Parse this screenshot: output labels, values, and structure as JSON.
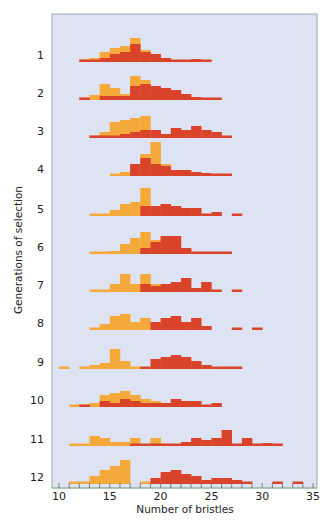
{
  "chart_data": {
    "type": "bar",
    "subtype": "stacked-histograms-by-generation",
    "title": "",
    "xlabel": "Number of bristles",
    "ylabel": "Generations of selection",
    "xlim": [
      10,
      35
    ],
    "xticks": [
      10,
      15,
      20,
      25,
      30,
      35
    ],
    "grid": false,
    "legend": null,
    "colors": {
      "low_line": "#F5A93A",
      "high_line": "#D9432A",
      "plot_bg": "#DDE3F2",
      "axis": "#9AA3B8"
    },
    "bin_start": 10,
    "bin_width": 1,
    "units_note": "relative frequency heights (px-scale estimates)",
    "generations": [
      {
        "gen": "1",
        "low": [
          0,
          0,
          2,
          4,
          10,
          14,
          16,
          24,
          12,
          8,
          4,
          0,
          0,
          0,
          0,
          0,
          0,
          0,
          0,
          0,
          0,
          0,
          0,
          0,
          0
        ],
        "high": [
          0,
          0,
          2,
          2,
          4,
          8,
          10,
          18,
          10,
          8,
          4,
          2,
          2,
          3,
          2,
          0,
          0,
          0,
          0,
          0,
          0,
          0,
          0,
          0,
          0
        ]
      },
      {
        "gen": "2",
        "low": [
          0,
          0,
          2,
          5,
          16,
          12,
          6,
          24,
          20,
          12,
          8,
          4,
          2,
          1,
          0,
          0,
          0,
          0,
          0,
          0,
          0,
          0,
          0,
          0,
          0
        ],
        "high": [
          0,
          0,
          2,
          0,
          4,
          4,
          4,
          14,
          16,
          14,
          12,
          10,
          6,
          3,
          2,
          1,
          0,
          0,
          0,
          0,
          0,
          0,
          0,
          0,
          0
        ]
      },
      {
        "gen": "3",
        "low": [
          0,
          0,
          0,
          1,
          6,
          16,
          18,
          20,
          22,
          0,
          0,
          0,
          0,
          0,
          0,
          0,
          0,
          0,
          0,
          0,
          0,
          0,
          0,
          0,
          0
        ],
        "high": [
          0,
          0,
          0,
          1,
          1,
          2,
          4,
          6,
          8,
          8,
          4,
          10,
          8,
          12,
          8,
          6,
          1,
          0,
          0,
          0,
          0,
          0,
          0,
          0,
          0
        ]
      },
      {
        "gen": "4",
        "low": [
          0,
          0,
          0,
          0,
          0,
          2,
          4,
          12,
          22,
          34,
          12,
          0,
          0,
          0,
          0,
          0,
          0,
          0,
          0,
          0,
          0,
          0,
          0,
          0,
          0
        ],
        "high": [
          0,
          0,
          0,
          0,
          0,
          0,
          0,
          12,
          18,
          12,
          10,
          6,
          6,
          4,
          3,
          1,
          1,
          0,
          0,
          0,
          0,
          0,
          0,
          0,
          0
        ]
      },
      {
        "gen": "5",
        "low": [
          0,
          0,
          0,
          1,
          2,
          6,
          12,
          14,
          28,
          0,
          0,
          0,
          0,
          0,
          0,
          0,
          0,
          0,
          0,
          0,
          0,
          0,
          0,
          0,
          0
        ],
        "high": [
          0,
          0,
          0,
          0,
          0,
          0,
          0,
          0,
          10,
          10,
          12,
          10,
          8,
          8,
          2,
          4,
          0,
          1,
          0,
          0,
          0,
          0,
          0,
          0,
          0
        ]
      },
      {
        "gen": "6",
        "low": [
          0,
          0,
          0,
          1,
          2,
          3,
          10,
          16,
          22,
          14,
          18,
          0,
          4,
          0,
          0,
          0,
          0,
          0,
          0,
          0,
          0,
          0,
          0,
          0,
          0
        ],
        "high": [
          0,
          0,
          0,
          0,
          0,
          0,
          0,
          0,
          6,
          12,
          18,
          18,
          6,
          2,
          2,
          1,
          1,
          0,
          0,
          0,
          0,
          0,
          0,
          0,
          0
        ]
      },
      {
        "gen": "7",
        "low": [
          0,
          0,
          0,
          1,
          2,
          8,
          18,
          8,
          18,
          8,
          0,
          0,
          0,
          0,
          0,
          0,
          0,
          0,
          0,
          0,
          0,
          0,
          0,
          0,
          0
        ],
        "high": [
          0,
          0,
          0,
          0,
          0,
          0,
          0,
          0,
          8,
          6,
          8,
          10,
          14,
          4,
          10,
          2,
          0,
          1,
          0,
          0,
          0,
          0,
          0,
          0,
          0
        ]
      },
      {
        "gen": "8",
        "low": [
          0,
          0,
          0,
          2,
          6,
          14,
          16,
          8,
          12,
          0,
          0,
          0,
          0,
          0,
          0,
          0,
          0,
          0,
          0,
          0,
          0,
          0,
          0,
          0,
          0
        ],
        "high": [
          0,
          0,
          0,
          0,
          0,
          0,
          0,
          0,
          0,
          8,
          12,
          14,
          8,
          12,
          4,
          0,
          0,
          1,
          0,
          1,
          0,
          0,
          0,
          0,
          0
        ]
      },
      {
        "gen": "9",
        "low": [
          1,
          0,
          2,
          4,
          6,
          20,
          8,
          2,
          0,
          0,
          0,
          0,
          0,
          0,
          0,
          0,
          0,
          0,
          0,
          0,
          0,
          0,
          0,
          0,
          0
        ],
        "high": [
          0,
          0,
          0,
          0,
          0,
          0,
          0,
          0,
          2,
          10,
          12,
          14,
          12,
          8,
          4,
          2,
          1,
          2,
          0,
          0,
          0,
          0,
          0,
          0,
          0
        ]
      },
      {
        "gen": "10",
        "low": [
          0,
          1,
          2,
          4,
          12,
          14,
          16,
          12,
          8,
          6,
          4,
          0,
          2,
          0,
          0,
          0,
          0,
          0,
          0,
          0,
          0,
          0,
          0,
          0,
          0
        ],
        "high": [
          0,
          0,
          1,
          0,
          6,
          4,
          8,
          6,
          4,
          4,
          4,
          8,
          6,
          6,
          2,
          4,
          0,
          0,
          0,
          0,
          0,
          0,
          0,
          0,
          0
        ]
      },
      {
        "gen": "11",
        "low": [
          0,
          1,
          2,
          10,
          8,
          4,
          4,
          8,
          0,
          8,
          2,
          0,
          0,
          0,
          0,
          0,
          0,
          0,
          0,
          0,
          0,
          0,
          0,
          0,
          0
        ],
        "high": [
          0,
          0,
          0,
          0,
          0,
          0,
          0,
          1,
          2,
          2,
          2,
          2,
          4,
          8,
          6,
          8,
          16,
          2,
          8,
          2,
          3,
          1,
          0,
          0,
          0
        ]
      },
      {
        "gen": "12",
        "low": [
          0,
          1,
          2,
          8,
          14,
          18,
          24,
          0,
          2,
          0,
          0,
          0,
          0,
          0,
          0,
          0,
          0,
          0,
          0,
          0,
          0,
          0,
          0,
          0,
          0
        ],
        "high": [
          0,
          0,
          0,
          0,
          0,
          0,
          0,
          0,
          0,
          6,
          12,
          14,
          10,
          8,
          4,
          6,
          6,
          4,
          1,
          0,
          0,
          1,
          0,
          2,
          0
        ]
      }
    ]
  },
  "axes": {
    "xlabel": "Number of bristles",
    "ylabel": "Generations of selection",
    "xtick_labels": [
      "10",
      "15",
      "20",
      "25",
      "30",
      "35"
    ],
    "ytick_labels": [
      "1",
      "2",
      "3",
      "4",
      "5",
      "6",
      "7",
      "8",
      "9",
      "10",
      "11",
      "12"
    ]
  }
}
